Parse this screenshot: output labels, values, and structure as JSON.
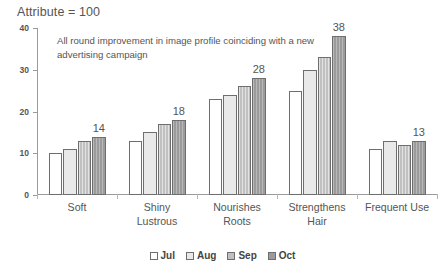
{
  "chart_data": {
    "type": "bar",
    "title": "Attribute = 100",
    "annotation": "All round improvement in image profile coinciding with a new advertising campaign",
    "xlabel": "",
    "ylabel": "",
    "ylim": [
      0,
      40
    ],
    "yticks": [
      0,
      10,
      20,
      30,
      40
    ],
    "grid": false,
    "legend_position": "bottom",
    "categories": [
      "Soft",
      "Shiny Lustrous",
      "Nourishes Roots",
      "Strengthens Hair",
      "Frequent Use"
    ],
    "category_lines": [
      [
        "Soft"
      ],
      [
        "Shiny",
        "Lustrous"
      ],
      [
        "Nourishes",
        "Roots"
      ],
      [
        "Strengthens",
        "Hair"
      ],
      [
        "Frequent Use"
      ]
    ],
    "series": [
      {
        "name": "Jul",
        "color": "#ffffff",
        "values": [
          10,
          13,
          23,
          25,
          11
        ]
      },
      {
        "name": "Aug",
        "color": "#e9e9e9",
        "values": [
          11,
          15,
          24,
          30,
          13
        ]
      },
      {
        "name": "Sep",
        "color": "#c0c0c0",
        "values": [
          13,
          17,
          26,
          33,
          12
        ]
      },
      {
        "name": "Oct",
        "color": "#9b9b9b",
        "values": [
          14,
          18,
          28,
          38,
          13
        ]
      }
    ],
    "data_labels": [
      "14",
      "18",
      "28",
      "38",
      "13"
    ],
    "data_label_series": "Oct"
  },
  "legend": {
    "items": [
      {
        "label": "Jul"
      },
      {
        "label": "Aug"
      },
      {
        "label": "Sep"
      },
      {
        "label": "Oct"
      }
    ]
  }
}
